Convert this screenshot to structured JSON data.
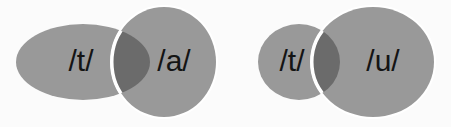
{
  "figure": {
    "background_color": "#fbfbfb",
    "type": "venn-pair-diagram",
    "colors": {
      "ellipse_fill": "#999999",
      "overlap_fill": "#6b6b6b",
      "outline_stroke": "#ffffff",
      "label_color": "#141414"
    }
  },
  "pairs": [
    {
      "id": "pair-ta",
      "left": {
        "label": "/t/",
        "cx": 83,
        "cy": 62,
        "rx": 67,
        "ry": 38,
        "fill": "#999999",
        "label_x": 81,
        "label_y": 63
      },
      "right": {
        "label": "/a/",
        "cx": 164,
        "cy": 62,
        "rx": 52,
        "ry": 55,
        "fill": "#999999",
        "label_x": 174,
        "label_y": 63
      }
    },
    {
      "id": "pair-tu",
      "left": {
        "label": "/t/",
        "cx": 299,
        "cy": 62,
        "rx": 41,
        "ry": 38,
        "fill": "#999999",
        "label_x": 292,
        "label_y": 63
      },
      "right": {
        "label": "/u/",
        "cx": 373,
        "cy": 62,
        "rx": 61,
        "ry": 55,
        "fill": "#999999",
        "label_x": 383,
        "label_y": 63
      }
    }
  ]
}
